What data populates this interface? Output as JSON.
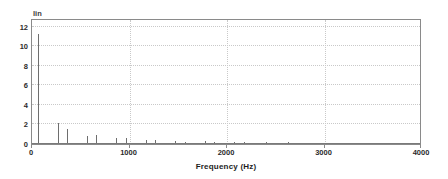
{
  "chart_data": {
    "type": "bar",
    "title": "",
    "subtitle": "",
    "scale_label": "lin",
    "xlabel": "Frequency (Hz)",
    "ylabel": "",
    "xlim": [
      0,
      4000
    ],
    "ylim": [
      0,
      12.9
    ],
    "grid": true,
    "legend": "none",
    "xticks": [
      0,
      1000,
      2000,
      3000,
      4000
    ],
    "xtick_labels": [
      "0",
      "1000",
      "2000",
      "3000",
      "4000"
    ],
    "yticks": [
      0,
      2,
      4,
      6,
      8,
      10,
      12
    ],
    "ytick_labels": [
      "0",
      "2",
      "4",
      "6",
      "8",
      "10",
      "12"
    ],
    "x": [
      65,
      165,
      265,
      360,
      460,
      560,
      660,
      760,
      860,
      965,
      1065,
      1165,
      1265,
      1370,
      1470,
      1570,
      1670,
      1770,
      1870,
      1970,
      2070,
      2170,
      2270,
      2400,
      2520,
      2630,
      2760,
      2870,
      2990,
      3110,
      3270,
      3430,
      3590,
      3760,
      3900
    ],
    "values": [
      11.3,
      0.12,
      2.2,
      1.5,
      0.1,
      0.85,
      0.95,
      0.1,
      0.6,
      0.65,
      0.08,
      0.42,
      0.4,
      0.07,
      0.35,
      0.2,
      0.07,
      0.32,
      0.22,
      0.06,
      0.2,
      0.18,
      0.05,
      0.16,
      0.1,
      0.16,
      0.07,
      0.13,
      0.06,
      0.12,
      0.12,
      0.05,
      0.06,
      0.05,
      0.04
    ]
  }
}
